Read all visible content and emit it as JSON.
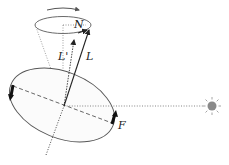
{
  "diagram": {
    "labels": {
      "north": "N",
      "angular_momentum": "L",
      "angular_momentum_new": "L'",
      "force": "F"
    },
    "elements": {
      "precession_arrow": "clockwise rotation arrow",
      "precession_cone": "cone of precession",
      "body": "tilted ellipse (equatorial bulge)",
      "sun": "sun",
      "sun_line": "dotted line toward the sun",
      "rotation_axis": "dotted rotation axis"
    },
    "colors": {
      "line": "#333333",
      "sun": "#8a8a8a",
      "sun_rays": "#9a9a9a"
    }
  }
}
